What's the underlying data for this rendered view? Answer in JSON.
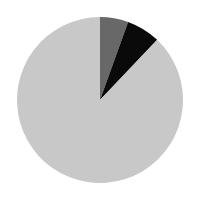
{
  "chart_data": {
    "type": "pie",
    "title": "",
    "start_angle_deg": 0,
    "direction": "clockwise",
    "center": [
      100,
      100
    ],
    "radius": 83,
    "slices": [
      {
        "label": "",
        "value": 5.5,
        "color": "#686868"
      },
      {
        "label": "",
        "value": 6.6,
        "color": "#0a0a0a"
      },
      {
        "label": "",
        "value": 87.9,
        "color": "#c8c8c8"
      }
    ],
    "legend": null,
    "data_labels": false
  }
}
